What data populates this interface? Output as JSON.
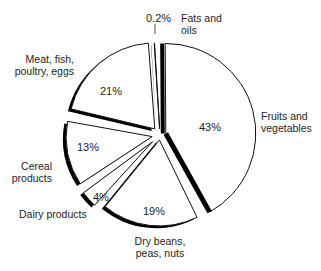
{
  "chart_data": {
    "type": "pie",
    "title": "",
    "style": "exploded pie with black shadow edges",
    "slices": [
      {
        "label": "Fruits and vegetables",
        "value": 43,
        "display": "43%"
      },
      {
        "label": "Dry beans, peas, nuts",
        "value": 19,
        "display": "19%"
      },
      {
        "label": "Dairy products",
        "value": 4,
        "display": "4%"
      },
      {
        "label": "Cereal products",
        "value": 13,
        "display": "13%"
      },
      {
        "label": "Meat, fish, poultry, eggs",
        "value": 21,
        "display": "21%"
      },
      {
        "label": "Fats and oils",
        "value": 0.2,
        "display": "0.2%"
      }
    ],
    "legend": "none (direct labels)",
    "colors": {
      "fill": "#ffffff",
      "edge": "#000000",
      "shadow": "#000000"
    }
  },
  "labels": {
    "fruits": [
      "Fruits and",
      "vegetables"
    ],
    "fruits_pct": "43%",
    "beans": [
      "Dry beans,",
      "peas, nuts"
    ],
    "beans_pct": "19%",
    "dairy": "Dairy products",
    "dairy_pct": "4%",
    "cereal": [
      "Cereal",
      "products"
    ],
    "cereal_pct": "13%",
    "meat": [
      "Meat, fish,",
      "poultry, eggs"
    ],
    "meat_pct": "21%",
    "fats": [
      "Fats and",
      "oils"
    ],
    "fats_pct": "0.2%"
  }
}
